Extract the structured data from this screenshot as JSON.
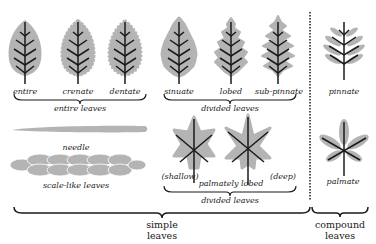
{
  "colors": {
    "leaf_fill": "#b4b4b4",
    "ink": "#1a1a1a",
    "background": "#ffffff"
  },
  "simple": {
    "entire_group": {
      "leaves": [
        {
          "label": "entire"
        },
        {
          "label": "crenate"
        },
        {
          "label": "dentate"
        }
      ],
      "group_label": "entire leaves"
    },
    "divided_top_group": {
      "leaves": [
        {
          "label": "sinuate"
        },
        {
          "label": "lobed"
        },
        {
          "label": "sub-pinnate"
        }
      ],
      "group_label": "divided leaves"
    },
    "needle": {
      "label": "needle"
    },
    "scale": {
      "label": "scale-like leaves"
    },
    "palmate_group": {
      "left_label": "(shallow)",
      "right_label": "(deep)",
      "center_label": "palmately lobed",
      "group_label": "divided leaves"
    },
    "title_line1": "simple",
    "title_line2": "leaves"
  },
  "compound": {
    "pinnate": {
      "label": "pinnate"
    },
    "palmate": {
      "label": "palmate"
    },
    "title_line1": "compound",
    "title_line2": "leaves"
  }
}
